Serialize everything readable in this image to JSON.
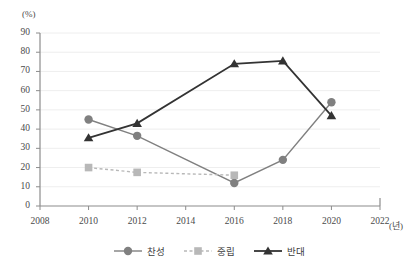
{
  "chart_data": {
    "type": "line",
    "title": "",
    "xlabel": "(년)",
    "ylabel": "(%)",
    "x": [
      2008,
      2010,
      2012,
      2014,
      2016,
      2018,
      2020,
      2022
    ],
    "xlim": [
      2008,
      2022
    ],
    "ylim": [
      0,
      90
    ],
    "ytick_step": 10,
    "grid": true,
    "legend_position": "bottom-center",
    "ytick_labels": [
      "0",
      "10",
      "20",
      "30",
      "40",
      "50",
      "60",
      "70",
      "80",
      "90"
    ],
    "xtick_labels": [
      "2008",
      "2010",
      "2012",
      "2014",
      "2016",
      "2018",
      "2020",
      "2022"
    ],
    "series": [
      {
        "name": "찬성",
        "marker": "circle",
        "line_style": "solid",
        "color": "#808080",
        "x": [
          2010,
          2012,
          2016,
          2018,
          2020
        ],
        "values": [
          45,
          36.5,
          12,
          24,
          54
        ]
      },
      {
        "name": "중립",
        "marker": "square",
        "line_style": "dashed",
        "color": "#b8b8b8",
        "x": [
          2010,
          2012,
          2016
        ],
        "values": [
          20,
          17.5,
          16
        ]
      },
      {
        "name": "반대",
        "marker": "triangle",
        "line_style": "solid",
        "color": "#333333",
        "x": [
          2010,
          2012,
          2016,
          2018,
          2020
        ],
        "values": [
          35.5,
          43,
          74,
          75.5,
          47
        ]
      }
    ]
  },
  "axis": {
    "y_unit": "(%)",
    "x_unit": "(년)",
    "axis_color": "#8c8c8c",
    "grid_color": "#eeeeee"
  },
  "legend": {
    "items": [
      {
        "label": "찬성"
      },
      {
        "label": "중립"
      },
      {
        "label": "반대"
      }
    ]
  }
}
